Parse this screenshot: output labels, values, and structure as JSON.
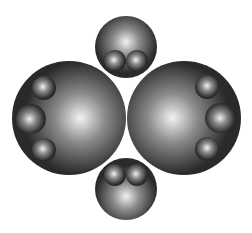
{
  "diagram": {
    "background": "#ffffff",
    "sphere_colors": {
      "highlight": "#f2f2f2",
      "mid": "#8a8a8a",
      "edge": "#2a2a2a"
    },
    "spheres": [
      {
        "id": "top-sphere",
        "cx": 126,
        "cy": 47,
        "r": 31,
        "light": [
          0.5,
          0.42
        ]
      },
      {
        "id": "top-inner-left",
        "cx": 115,
        "cy": 61,
        "r": 11,
        "light": [
          0.45,
          0.45
        ]
      },
      {
        "id": "top-inner-right",
        "cx": 137,
        "cy": 61,
        "r": 11,
        "light": [
          0.45,
          0.45
        ]
      },
      {
        "id": "left-sphere",
        "cx": 69,
        "cy": 118,
        "r": 57,
        "light": [
          0.6,
          0.5
        ]
      },
      {
        "id": "left-inner-top",
        "cx": 44,
        "cy": 88,
        "r": 12,
        "light": [
          0.45,
          0.45
        ]
      },
      {
        "id": "left-inner-middle",
        "cx": 31,
        "cy": 119,
        "r": 15,
        "light": [
          0.45,
          0.5
        ]
      },
      {
        "id": "left-inner-bottom",
        "cx": 44,
        "cy": 150,
        "r": 12,
        "light": [
          0.45,
          0.45
        ]
      },
      {
        "id": "right-sphere",
        "cx": 184,
        "cy": 118,
        "r": 57,
        "light": [
          0.4,
          0.5
        ]
      },
      {
        "id": "right-inner-top",
        "cx": 207,
        "cy": 87,
        "r": 12,
        "light": [
          0.5,
          0.45
        ]
      },
      {
        "id": "right-inner-middle",
        "cx": 220,
        "cy": 118,
        "r": 15,
        "light": [
          0.5,
          0.5
        ]
      },
      {
        "id": "right-inner-bottom",
        "cx": 207,
        "cy": 149,
        "r": 12,
        "light": [
          0.5,
          0.45
        ]
      },
      {
        "id": "bottom-sphere",
        "cx": 126,
        "cy": 189,
        "r": 31,
        "light": [
          0.5,
          0.62
        ]
      },
      {
        "id": "bottom-inner-left",
        "cx": 115,
        "cy": 175,
        "r": 11,
        "light": [
          0.45,
          0.45
        ]
      },
      {
        "id": "bottom-inner-right",
        "cx": 137,
        "cy": 175,
        "r": 11,
        "light": [
          0.45,
          0.45
        ]
      }
    ]
  }
}
